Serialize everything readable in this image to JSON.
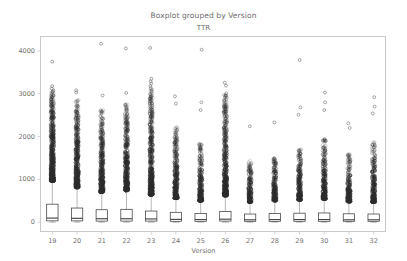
{
  "chart_data": {
    "type": "boxplot",
    "title": "Boxplot grouped by Version",
    "subtitle": "TTR",
    "xlabel": "Version",
    "ylabel": "",
    "grid": false,
    "legend": null,
    "ylim": [
      -230,
      4350
    ],
    "yticks": [
      0,
      1000,
      2000,
      3000,
      4000
    ],
    "ytick_labels": [
      "0",
      "1000",
      "2000",
      "3000",
      "4000"
    ],
    "categories": [
      "19",
      "20",
      "21",
      "22",
      "23",
      "24",
      "25",
      "26",
      "27",
      "28",
      "29",
      "30",
      "31",
      "32"
    ],
    "xtick_labels": [
      "19",
      "20",
      "21",
      "22",
      "23",
      "24",
      "25",
      "26",
      "27",
      "28",
      "29",
      "30",
      "31",
      "32"
    ],
    "colors": {
      "box_edge": "#3f3f3f",
      "median": "#3f3f3f",
      "whisker": "#9a9a9a",
      "outlier_edge": "#2b2b2b",
      "axis": "#c9c9c9",
      "text": "#6f6f6f"
    },
    "boxes": [
      {
        "version": "19",
        "q1": 30,
        "median": 95,
        "q3": 420,
        "whisker_low": 0,
        "whisker_high": 960,
        "outlier_max": 3750,
        "outlier_dense_top": 3050,
        "outlier_count": 520
      },
      {
        "version": "20",
        "q1": 30,
        "median": 90,
        "q3": 330,
        "whisker_low": 0,
        "whisker_high": 810,
        "outlier_max": 3080,
        "outlier_dense_top": 2860,
        "outlier_count": 420
      },
      {
        "version": "21",
        "q1": 25,
        "median": 80,
        "q3": 290,
        "whisker_low": 0,
        "whisker_high": 700,
        "outlier_max": 4170,
        "outlier_dense_top": 2620,
        "outlier_count": 360
      },
      {
        "version": "22",
        "q1": 25,
        "median": 80,
        "q3": 300,
        "whisker_low": 0,
        "whisker_high": 740,
        "outlier_max": 4060,
        "outlier_dense_top": 2760,
        "outlier_count": 380
      },
      {
        "version": "23",
        "q1": 25,
        "median": 75,
        "q3": 260,
        "whisker_low": 0,
        "whisker_high": 640,
        "outlier_max": 4070,
        "outlier_dense_top": 3100,
        "outlier_count": 470
      },
      {
        "version": "24",
        "q1": 20,
        "median": 65,
        "q3": 230,
        "whisker_low": 0,
        "whisker_high": 560,
        "outlier_max": 2940,
        "outlier_dense_top": 2250,
        "outlier_count": 300
      },
      {
        "version": "25",
        "q1": 20,
        "median": 60,
        "q3": 200,
        "whisker_low": 0,
        "whisker_high": 500,
        "outlier_max": 4030,
        "outlier_dense_top": 1850,
        "outlier_count": 240
      },
      {
        "version": "26",
        "q1": 25,
        "median": 70,
        "q3": 250,
        "whisker_low": 0,
        "whisker_high": 620,
        "outlier_max": 3260,
        "outlier_dense_top": 3010,
        "outlier_count": 430
      },
      {
        "version": "27",
        "q1": 20,
        "median": 55,
        "q3": 190,
        "whisker_low": 0,
        "whisker_high": 470,
        "outlier_max": 2240,
        "outlier_dense_top": 1450,
        "outlier_count": 190
      },
      {
        "version": "28",
        "q1": 20,
        "median": 60,
        "q3": 200,
        "whisker_low": 0,
        "whisker_high": 500,
        "outlier_max": 2330,
        "outlier_dense_top": 1520,
        "outlier_count": 210
      },
      {
        "version": "29",
        "q1": 20,
        "median": 60,
        "q3": 210,
        "whisker_low": 0,
        "whisker_high": 520,
        "outlier_max": 3790,
        "outlier_dense_top": 1700,
        "outlier_count": 230
      },
      {
        "version": "30",
        "q1": 20,
        "median": 60,
        "q3": 215,
        "whisker_low": 0,
        "whisker_high": 540,
        "outlier_max": 3030,
        "outlier_dense_top": 1950,
        "outlier_count": 260
      },
      {
        "version": "31",
        "q1": 20,
        "median": 55,
        "q3": 195,
        "whisker_low": 0,
        "whisker_high": 480,
        "outlier_max": 2310,
        "outlier_dense_top": 1600,
        "outlier_count": 200
      },
      {
        "version": "32",
        "q1": 20,
        "median": 55,
        "q3": 190,
        "whisker_low": 0,
        "whisker_high": 470,
        "outlier_max": 2920,
        "outlier_dense_top": 1880,
        "outlier_count": 230
      }
    ],
    "sparse_outliers": [
      {
        "version": "19",
        "values": [
          3750,
          3180,
          3120,
          3080,
          3050
        ]
      },
      {
        "version": "20",
        "values": [
          3080,
          3030
        ]
      },
      {
        "version": "21",
        "values": [
          4170,
          2960
        ]
      },
      {
        "version": "22",
        "values": [
          4060,
          3020
        ]
      },
      {
        "version": "23",
        "values": [
          4070,
          3350,
          3290,
          3240,
          3180,
          3130
        ]
      },
      {
        "version": "24",
        "values": [
          2940,
          2770
        ]
      },
      {
        "version": "25",
        "values": [
          4030,
          2800,
          2620
        ]
      },
      {
        "version": "26",
        "values": [
          3260,
          3190,
          3010,
          2960
        ]
      },
      {
        "version": "27",
        "values": [
          2240
        ]
      },
      {
        "version": "28",
        "values": [
          2330
        ]
      },
      {
        "version": "29",
        "values": [
          3790,
          2680,
          2510
        ]
      },
      {
        "version": "30",
        "values": [
          3030,
          2800,
          2620
        ]
      },
      {
        "version": "31",
        "values": [
          2310,
          2200
        ]
      },
      {
        "version": "32",
        "values": [
          2920,
          2700,
          2540
        ]
      }
    ]
  }
}
